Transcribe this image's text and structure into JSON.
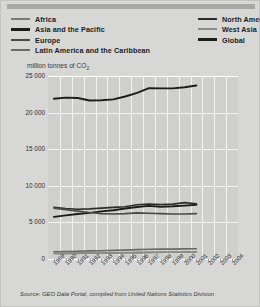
{
  "legend": {
    "left": [
      {
        "label": "Africa",
        "color": "#7a7a78"
      },
      {
        "label": "Asia and the Pacific",
        "color": "#1c1c1c"
      },
      {
        "label": "Europe",
        "color": "#4a4a48"
      },
      {
        "label": "Latin America and the Caribbean",
        "color": "#6a6a68"
      }
    ],
    "right": [
      {
        "label": "North America",
        "color": "#2c2c2a"
      },
      {
        "label": "West Asia",
        "color": "#8a8a88"
      },
      {
        "label": "Global",
        "color": "#1c1c1c"
      }
    ]
  },
  "source": "Source: GEO Data Portal, compiled from United Nations Statistics Division",
  "chart_data": {
    "type": "line",
    "title": "",
    "subtitle": "",
    "ylabel": "million tonnes of CO2",
    "ylabel_html": "million tonnes of CO<sub>2</sub>",
    "xlabel": "",
    "ylim": [
      0,
      25000
    ],
    "yticks": [
      0,
      5000,
      10000,
      15000,
      20000,
      25000
    ],
    "ytick_labels": [
      "0",
      "5 000",
      "10 000",
      "15 000",
      "20 000",
      "25 000"
    ],
    "grid": true,
    "legend_position": "top",
    "x": [
      1989,
      1990,
      1991,
      1992,
      1993,
      1994,
      1995,
      1996,
      1997,
      1998,
      1999,
      2000,
      2001,
      2002,
      2003,
      2004
    ],
    "xtick_labels": [
      "1989",
      "1990",
      "1991",
      "1992",
      "1993",
      "1994",
      "1995",
      "1996",
      "1997",
      "1998",
      "1999",
      "2000",
      "2001",
      "2002",
      "2003",
      "2004"
    ],
    "series": [
      {
        "name": "Global",
        "color": "#1c1c1c",
        "values": [
          21900,
          22050,
          22000,
          21650,
          21700,
          21800,
          22200,
          22700,
          23350,
          23300,
          23300,
          23450,
          23700,
          null,
          null,
          null
        ]
      },
      {
        "name": "Asia and the Pacific",
        "color": "#1c1c1c",
        "values": [
          5750,
          5950,
          6150,
          6300,
          6500,
          6650,
          6900,
          7100,
          7250,
          7150,
          7200,
          7300,
          7400,
          null,
          null,
          null
        ]
      },
      {
        "name": "North America",
        "color": "#2c2c2a",
        "values": [
          7050,
          6900,
          6800,
          6850,
          6950,
          7050,
          7150,
          7400,
          7500,
          7450,
          7500,
          7700,
          7550,
          null,
          null,
          null
        ]
      },
      {
        "name": "Europe",
        "color": "#4a4a48",
        "values": [
          6950,
          6750,
          6550,
          6350,
          6200,
          6150,
          6200,
          6300,
          6250,
          6200,
          6150,
          6150,
          6200,
          null,
          null,
          null
        ]
      },
      {
        "name": "Latin America and the Caribbean",
        "color": "#6a6a68",
        "values": [
          1000,
          1030,
          1070,
          1100,
          1130,
          1180,
          1220,
          1280,
          1330,
          1360,
          1350,
          1380,
          1400,
          null,
          null,
          null
        ]
      },
      {
        "name": "Africa",
        "color": "#7a7a78",
        "values": [
          780,
          790,
          800,
          810,
          820,
          840,
          860,
          880,
          900,
          920,
          930,
          950,
          970,
          null,
          null,
          null
        ]
      },
      {
        "name": "West Asia",
        "color": "#8a8a88",
        "values": [
          720,
          740,
          760,
          790,
          810,
          830,
          860,
          880,
          900,
          920,
          940,
          960,
          980,
          null,
          null,
          null
        ]
      }
    ]
  }
}
